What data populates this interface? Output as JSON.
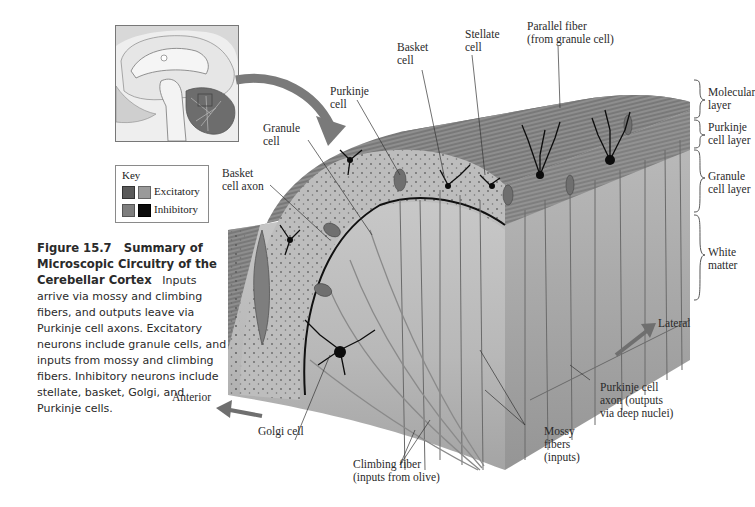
{
  "figure": {
    "number": "Figure 15.7",
    "title": "Summary of Microscopic Circuitry of the Cerebellar Cortex",
    "caption_title_line1": "Figure 15.7   Summary of",
    "caption_title_line2": "Microscopic Circuitry of the",
    "caption_title_line3": "Cerebellar Cortex",
    "caption_body_start": "Inputs",
    "caption_lines": [
      "arrive via mossy and climbing",
      "fibers, and outputs leave via",
      "Purkinje cell axons. Excitatory",
      "neurons include granule cells, and",
      "inputs from mossy and climbing",
      "fibers. Inhibitory neurons include",
      "stellate, basket, Golgi, and",
      "Purkinje cells."
    ]
  },
  "key": {
    "title": "Key",
    "items": [
      {
        "label": "Excitatory",
        "colors": [
          "#5a5a5a",
          "#9a9a9a"
        ]
      },
      {
        "label": "Inhibitory",
        "colors": [
          "#7e7e7e",
          "#0c0c0c"
        ]
      }
    ]
  },
  "labels": {
    "parallel_fiber": "Parallel fiber\n(from granule cell)",
    "stellate_cell": "Stellate\ncell",
    "basket_cell": "Basket\ncell",
    "purkinje_cell": "Purkinje\ncell",
    "granule_cell": "Granule\ncell",
    "basket_cell_axon": "Basket\ncell axon",
    "golgi_cell": "Golgi cell",
    "climbing_fiber": "Climbing fiber\n(inputs from olive)",
    "mossy_fibers": "Mossy\nfibers\n(inputs)",
    "purkinje_axon": "Purkinje cell\naxon (outputs\nvia deep nuclei)",
    "anterior": "Anterior",
    "lateral": "Lateral"
  },
  "layers": [
    {
      "label": "Molecular\nlayer"
    },
    {
      "label": "Purkinje\ncell layer"
    },
    {
      "label": "Granule\ncell layer"
    },
    {
      "label": "White\nmatter"
    }
  ],
  "colors": {
    "block_top": "#8c8c8c",
    "block_front": "#b4b4b4",
    "block_side": "#a0a0a0",
    "inhibitory": "#0c0c0c",
    "arrow": "#6f6f6f"
  }
}
